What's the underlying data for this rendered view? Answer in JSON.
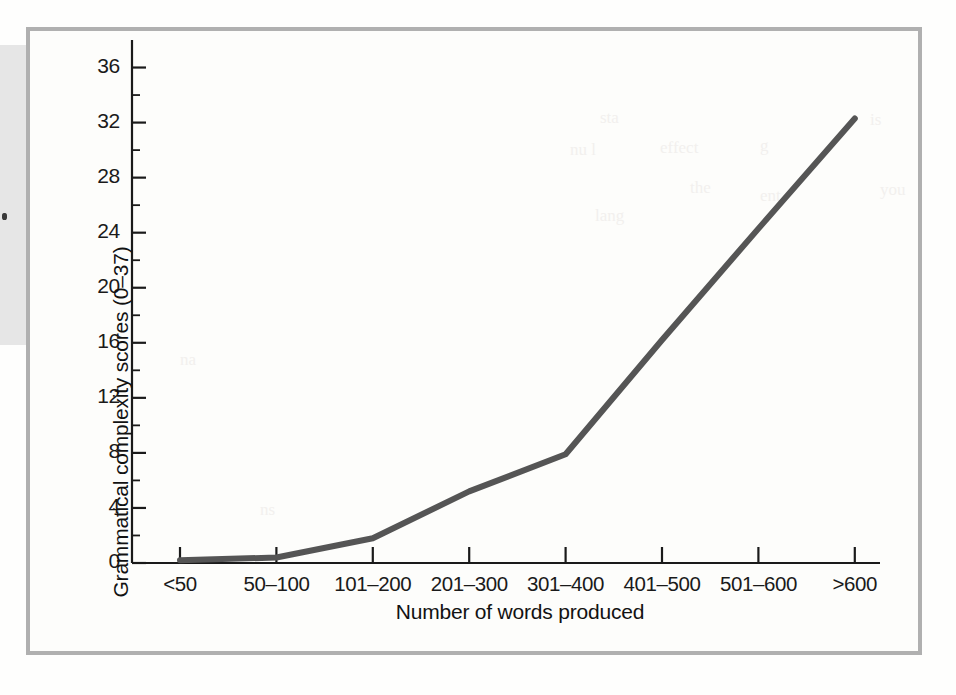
{
  "figure": {
    "kind": "line-chart-figure",
    "frame_color": "#b0b0b0",
    "page_color": "#fdfdfb"
  },
  "chart_data": {
    "type": "line",
    "title": "",
    "xlabel": "Number of words produced",
    "ylabel": "Grammatical complexity scores (0–37)",
    "categories": [
      "<50",
      "50–100",
      "101–200",
      "201–300",
      "301–400",
      "401–500",
      "501–600",
      ">600"
    ],
    "values": [
      0.2,
      0.4,
      1.8,
      5.2,
      7.9,
      16.2,
      24.3,
      32.3
    ],
    "series": [
      {
        "name": "Grammatical complexity",
        "values": [
          0.2,
          0.4,
          1.8,
          5.2,
          7.9,
          16.2,
          24.3,
          32.3
        ],
        "color": "#555555",
        "line_width": 6
      }
    ],
    "ylim": [
      0,
      38
    ],
    "xlim_categories": 8,
    "y_major_ticks": [
      0,
      4,
      8,
      12,
      16,
      20,
      24,
      28,
      32,
      36
    ],
    "y_minor_step": 2,
    "y_tick_labels": [
      "0",
      "4",
      "8",
      "12",
      "16",
      "20",
      "24",
      "28",
      "32",
      "36"
    ],
    "grid": false,
    "legend": false,
    "legend_position": "none",
    "axis_color": "#1a1a1a"
  },
  "artifacts": {
    "left_band_color": "#e6e6e6",
    "bleed_through_text": [
      "sta",
      "nu l",
      "ous",
      "effect",
      "g",
      "t",
      "is",
      "the",
      "ent",
      "you",
      "lang",
      "Arla-lurA"
    ]
  }
}
